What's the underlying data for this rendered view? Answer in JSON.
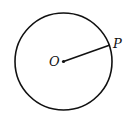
{
  "diagram": {
    "center_label": "O",
    "point_label": "P",
    "stroke_color": "#111111",
    "background": "#ffffff"
  }
}
